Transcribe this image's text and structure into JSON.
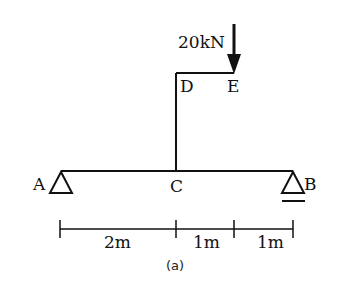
{
  "diagram": {
    "type": "structural-beam",
    "caption": "(a)",
    "load": {
      "label": "20kN",
      "point": "E",
      "direction": "down"
    },
    "nodes": {
      "A": "A",
      "B": "B",
      "C": "C",
      "D": "D",
      "E": "E"
    },
    "supports": [
      {
        "node": "A",
        "type": "pin"
      },
      {
        "node": "B",
        "type": "roller"
      }
    ],
    "dimensions": [
      {
        "label": "2m",
        "from": "A",
        "to": "C"
      },
      {
        "label": "1m",
        "from": "C",
        "to": "E"
      },
      {
        "label": "1m",
        "from": "E",
        "to": "B"
      }
    ],
    "colors": {
      "line": "#111111",
      "background": "#ffffff"
    }
  }
}
